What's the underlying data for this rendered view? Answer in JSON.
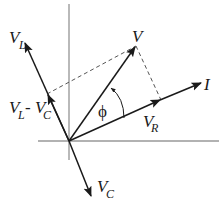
{
  "diagram": {
    "type": "phasor-diagram",
    "colors": {
      "vector": "#1a1a1a",
      "axis": "#8a8a8a",
      "dashed": "#555555",
      "background": "#ffffff"
    },
    "labels": {
      "V": "V",
      "I": "I",
      "VL_main": "V",
      "VL_sub": "L",
      "VC_main": "V",
      "VC_sub": "C",
      "VR_main": "V",
      "VR_sub": "R",
      "VLC_main1": "V",
      "VLC_sub1": "L",
      "VLC_minus": " - ",
      "VLC_main2": "V",
      "VLC_sub2": "C",
      "phi": "ϕ"
    }
  }
}
